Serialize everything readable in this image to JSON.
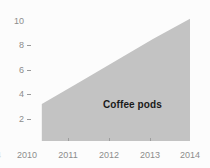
{
  "chart_data": {
    "type": "area",
    "title": "",
    "subtitle": "",
    "xlabel": "",
    "ylabel": "",
    "x": [
      2010,
      2011,
      2012,
      2013,
      2014
    ],
    "series": [
      {
        "name": "Coffee pods",
        "values": [
          2.9,
          4.6,
          6.3,
          8.0,
          9.6
        ],
        "color": "#c3c3c3"
      }
    ],
    "x_tick_labels": [
      "2010",
      "2011",
      "2012",
      "2013",
      "2014"
    ],
    "x_tick_label_clipped_left": "4",
    "y_tick_labels": [
      "2",
      "4",
      "6",
      "8",
      "10"
    ],
    "y_tick_values": [
      2,
      4,
      6,
      8,
      10
    ],
    "xlim": [
      2009.6,
      2014.0
    ],
    "ylim": [
      0,
      10.6
    ],
    "grid": false,
    "legend": "inline-annotation",
    "annotations": [
      {
        "text": "Coffee pods",
        "x": 2012.45,
        "y": 3.6
      }
    ]
  },
  "figure": {
    "background_color": "#fcfcfc",
    "tick_text_color": "#8c8c8c",
    "annotation_text_color": "#1a1a1a",
    "area_fill_color": "#c3c3c3"
  },
  "axis": {
    "y_ticks": [
      {
        "label": "10",
        "dash": false
      },
      {
        "label": "8",
        "dash": true
      },
      {
        "label": "6",
        "dash": true
      },
      {
        "label": "4",
        "dash": true
      },
      {
        "label": "2",
        "dash": true
      }
    ],
    "x_ticks": [
      {
        "label": "4"
      },
      {
        "label": "2010"
      },
      {
        "label": "2011"
      },
      {
        "label": "2012"
      },
      {
        "label": "2013"
      },
      {
        "label": "2014"
      }
    ]
  }
}
